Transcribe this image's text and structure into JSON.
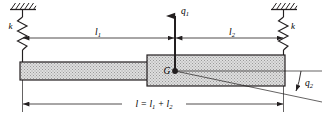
{
  "figure": {
    "type": "mechanical-free-body-diagram",
    "colors": {
      "line": "#231f20",
      "beam_fill": "#d9d9d9",
      "hatch": "#231f20",
      "background": "#ffffff"
    }
  },
  "labels": {
    "spring_left": "k",
    "spring_right": "k",
    "coordinate_vertical": "q",
    "coordinate_vertical_sub": "1",
    "coordinate_angular": "q",
    "coordinate_angular_sub": "2",
    "center_of_mass": "G",
    "length_left": "l",
    "length_left_sub": "1",
    "length_right": "l",
    "length_right_sub": "2",
    "total_length_prefix": "l = l",
    "total_length_sub1": "1",
    "total_length_mid": " + l",
    "total_length_sub2": "2"
  },
  "geometry": {
    "beam_left_x": 20,
    "beam_right_x": 285,
    "step_x": 147,
    "thin_top_y": 62,
    "thin_bottom_y": 80,
    "thick_top_y": 55,
    "thick_bottom_y": 86,
    "g_x": 175,
    "g_y": 71,
    "ceiling_left_x": 22,
    "ceiling_right_x": 283,
    "dim_upper_y": 38,
    "dim_lower_y": 104,
    "rotation_angle_deg": 12
  }
}
